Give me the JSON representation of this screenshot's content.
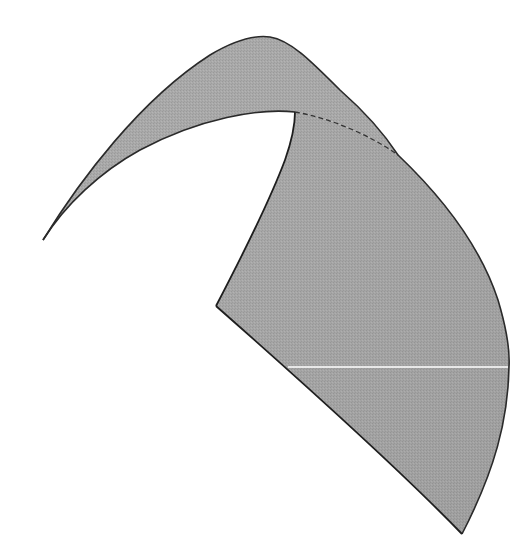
{
  "figure": {
    "background": "#ffffff",
    "fill_color": "#a8a8a8",
    "fill_color_dark": "#9c9c9c",
    "edge_color": "#2a2a2a",
    "highlight_line_color": "#ffffff",
    "vertices": {
      "left_tip": [
        43,
        240
      ],
      "top_peak": [
        262,
        36
      ],
      "inner_corner": [
        295,
        112
      ],
      "left_inner_corner": [
        216,
        306
      ],
      "bottom_tip": [
        462,
        534
      ],
      "right_extreme": [
        509,
        367
      ]
    },
    "highlight_line": {
      "x1": 288,
      "x2": 509,
      "y": 367
    }
  }
}
